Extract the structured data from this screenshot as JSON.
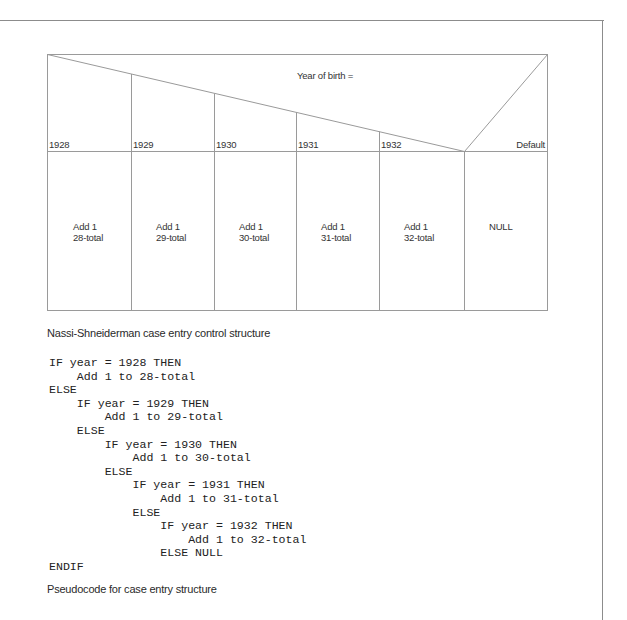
{
  "diagram": {
    "condition_label": "Year of birth =",
    "cases": [
      {
        "value": "1928",
        "action_line1": "Add 1",
        "action_line2": "28-total"
      },
      {
        "value": "1929",
        "action_line1": "Add 1",
        "action_line2": "29-total"
      },
      {
        "value": "1930",
        "action_line1": "Add 1",
        "action_line2": "30-total"
      },
      {
        "value": "1931",
        "action_line1": "Add 1",
        "action_line2": "31-total"
      },
      {
        "value": "1932",
        "action_line1": "Add 1",
        "action_line2": "32-total"
      }
    ],
    "default": {
      "label": "Default",
      "action": "NULL"
    },
    "caption": "Nassi-Shneiderman case entry control structure"
  },
  "pseudocode": {
    "lines": [
      {
        "indent": 0,
        "text": "IF year = 1928 THEN"
      },
      {
        "indent": 4,
        "text": "Add 1 to 28-total"
      },
      {
        "indent": 0,
        "text": "ELSE"
      },
      {
        "indent": 4,
        "text": "IF year = 1929 THEN"
      },
      {
        "indent": 8,
        "text": "Add 1 to 29-total"
      },
      {
        "indent": 4,
        "text": "ELSE"
      },
      {
        "indent": 8,
        "text": "IF year = 1930 THEN"
      },
      {
        "indent": 12,
        "text": "Add 1 to 30-total"
      },
      {
        "indent": 8,
        "text": "ELSE"
      },
      {
        "indent": 12,
        "text": "IF year = 1931 THEN"
      },
      {
        "indent": 16,
        "text": "Add 1 to 31-total"
      },
      {
        "indent": 12,
        "text": "ELSE"
      },
      {
        "indent": 16,
        "text": "IF year = 1932 THEN"
      },
      {
        "indent": 20,
        "text": "Add 1 to 32-total"
      },
      {
        "indent": 16,
        "text": "ELSE NULL"
      },
      {
        "indent": 0,
        "text": "ENDIF"
      }
    ],
    "caption": "Pseudocode for case entry structure"
  },
  "colors": {
    "line": "#9a9a9a",
    "frame": "#8c8c8c",
    "text": "#2a2a2a"
  }
}
